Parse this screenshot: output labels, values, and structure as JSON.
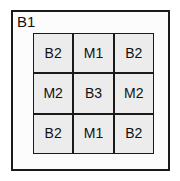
{
  "diagram": {
    "type": "nested-block-diagram",
    "outer_block": {
      "label": "B1"
    },
    "grid": {
      "rows": 3,
      "columns": 3,
      "cells": [
        {
          "label": "B2",
          "row": 1,
          "column": 1
        },
        {
          "label": "M1",
          "row": 1,
          "column": 2
        },
        {
          "label": "B2",
          "row": 1,
          "column": 3
        },
        {
          "label": "M2",
          "row": 2,
          "column": 1
        },
        {
          "label": "B3",
          "row": 2,
          "column": 2
        },
        {
          "label": "M2",
          "row": 2,
          "column": 3
        },
        {
          "label": "B2",
          "row": 3,
          "column": 1
        },
        {
          "label": "M1",
          "row": 3,
          "column": 2
        },
        {
          "label": "B2",
          "row": 3,
          "column": 3
        }
      ]
    },
    "colors": {
      "page_background": "#ffffff",
      "outer_fill": "#fcfcfc",
      "cell_fill": "#ececec",
      "border": "#1a1a1a",
      "text": "#111111"
    }
  }
}
